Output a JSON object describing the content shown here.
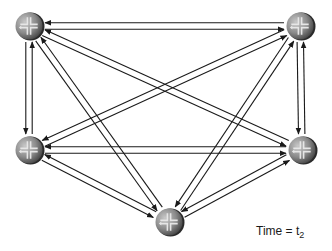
{
  "diagram": {
    "type": "full-mesh-network",
    "line_color": "#1a1a1a",
    "router_colors": {
      "body_light": "#b8b8b8",
      "body_mid": "#8a8a8a",
      "body_dark": "#3c3c3c",
      "cross": "#e6e6e6",
      "rim": "#2a2a2a"
    },
    "routers": [
      {
        "id": "TL",
        "name": "router-top-left",
        "x": 29,
        "y": 26,
        "r": 14
      },
      {
        "id": "TR",
        "name": "router-top-right",
        "x": 300,
        "y": 26,
        "r": 14
      },
      {
        "id": "ML",
        "name": "router-middle-left",
        "x": 29,
        "y": 150,
        "r": 14
      },
      {
        "id": "MR",
        "name": "router-middle-right",
        "x": 302,
        "y": 150,
        "r": 14
      },
      {
        "id": "B",
        "name": "router-bottom",
        "x": 169,
        "y": 222,
        "r": 14
      }
    ],
    "links": [
      {
        "from": "TL",
        "to": "TR"
      },
      {
        "from": "TL",
        "to": "ML"
      },
      {
        "from": "TL",
        "to": "MR"
      },
      {
        "from": "TL",
        "to": "B"
      },
      {
        "from": "TR",
        "to": "ML"
      },
      {
        "from": "TR",
        "to": "MR"
      },
      {
        "from": "TR",
        "to": "B"
      },
      {
        "from": "ML",
        "to": "MR"
      },
      {
        "from": "ML",
        "to": "B"
      },
      {
        "from": "MR",
        "to": "B"
      }
    ],
    "arrow_pair_offset": 3.2
  },
  "label": {
    "prefix": "Time = t",
    "subscript": "2"
  }
}
